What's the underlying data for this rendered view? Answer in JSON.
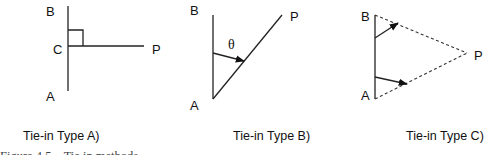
{
  "figure": {
    "caption": "Figure 4.5    Tie in methods",
    "panels": [
      {
        "id": "A",
        "title": "Tie-in Type A)",
        "points": {
          "B": "B",
          "C": "C",
          "P": "P",
          "A": "A"
        },
        "description": "Perpendicular offset from point P to line AB meeting at C with right angle"
      },
      {
        "id": "B",
        "title": "Tie-in Type B)",
        "points": {
          "B": "B",
          "P": "P",
          "A": "A"
        },
        "angle_symbol": "θ",
        "description": "Angle θ measured from line AB to line AP"
      },
      {
        "id": "C",
        "title": "Tie-in Type C)",
        "points": {
          "B": "B",
          "P": "P",
          "A": "A"
        },
        "description": "Dashed ties from both A and B to P forming a triangle"
      }
    ]
  },
  "colors": {
    "line": "#222222",
    "text": "#111111",
    "background": "#ffffff"
  }
}
